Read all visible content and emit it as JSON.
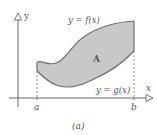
{
  "figure": {
    "caption": "(a)",
    "axes": {
      "x_label": "x",
      "y_label": "y"
    },
    "ticks": {
      "a": "a",
      "b": "b"
    },
    "curves": {
      "upper": "y = f(x)",
      "lower": "y = g(x)"
    },
    "region_label": "A",
    "colors": {
      "region_fill": "#c8c8c8",
      "curve_stroke": "#6e6e6e",
      "axis_stroke": "#555555",
      "dash_stroke": "#777777"
    }
  }
}
